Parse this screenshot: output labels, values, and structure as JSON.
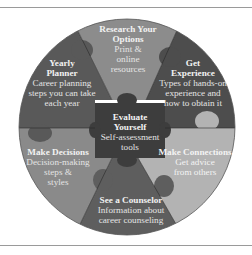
{
  "diagram": {
    "type": "puzzle-wheel",
    "colors": {
      "research": "#8c8c8c",
      "planner": "#595959",
      "experience": "#4d4d4d",
      "decisions": "#8a8a8a",
      "connections": "#b3b3b3",
      "counselor": "#5e5e5e",
      "center": "#3d3d3d",
      "text": "#f2f2f2"
    },
    "center": {
      "title_line1": "Evaluate",
      "title_line2": "Yourself",
      "desc_line1": "Self-assessment",
      "desc_line2": "tools"
    },
    "segments": [
      {
        "id": "research",
        "title_line1": "Research Your",
        "title_line2": "Options",
        "desc_line1": "Print &",
        "desc_line2": "online",
        "desc_line3": "resources"
      },
      {
        "id": "experience",
        "title_line1": "Get",
        "title_line2": "Experience",
        "desc_line1": "Types of hands-on",
        "desc_line2": "experience and",
        "desc_line3": "how to obtain it"
      },
      {
        "id": "connections",
        "title_line1": "Make Connections",
        "desc_line1": "Get advice",
        "desc_line2": "from others"
      },
      {
        "id": "counselor",
        "title_line1": "See a Counselor",
        "desc_line1": "Information about",
        "desc_line2": "career counseling"
      },
      {
        "id": "decisions",
        "title_line1": "Make Decisions",
        "desc_line1": "Decision-making",
        "desc_line2": "steps &",
        "desc_line3": "styles"
      },
      {
        "id": "planner",
        "title_line1": "Yearly",
        "title_line2": "Planner",
        "desc_line1": "Career planning",
        "desc_line2": "steps you can take",
        "desc_line3": "each year"
      }
    ]
  }
}
